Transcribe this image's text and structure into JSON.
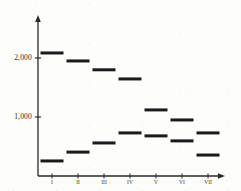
{
  "chart_data": {
    "type": "bar",
    "title": "",
    "subtitle": "",
    "xlabel": "",
    "ylabel": "",
    "ylim": [
      0,
      2400
    ],
    "xlim": [
      0,
      8
    ],
    "grid": false,
    "legend": "none",
    "categories": [
      "I",
      "II",
      "III",
      "IV",
      "V",
      "VI",
      "VII"
    ],
    "y_ticks": [
      {
        "value": 1000,
        "label": "1,000"
      },
      {
        "value": 2000,
        "label": "2,000"
      }
    ],
    "series": [
      {
        "name": "upper",
        "marker": "horizontal-level-bar",
        "values": [
          2085,
          1950,
          1800,
          1645,
          1120,
          950,
          730
        ]
      },
      {
        "name": "lower",
        "marker": "horizontal-level-bar",
        "values": [
          255,
          405,
          560,
          730,
          680,
          595,
          355
        ]
      }
    ]
  },
  "axes": {
    "y_axis_name": "y-axis",
    "x_axis_name": "x-axis",
    "arrow_heads": true
  },
  "geometry": {
    "axis_x": 38,
    "axis_y_top": 17,
    "axis_y_baseline": 176,
    "axis_x_right": 224,
    "tick_2000_y": 58,
    "tick_1000_y": 117,
    "px_per_1000": 59,
    "category_x": [
      52,
      78,
      104,
      130,
      156,
      182,
      208
    ],
    "bar_width": 23,
    "bar_height": 3
  },
  "colors": {
    "ink": "#1a1a1a",
    "axis": "#2a2a2a",
    "background": "#fdfdfc",
    "tick_text": "#2b2b2b"
  }
}
